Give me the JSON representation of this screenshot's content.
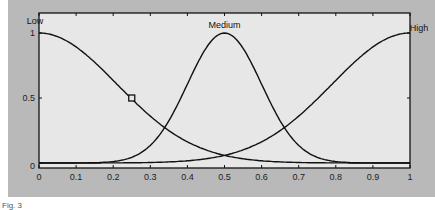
{
  "chart_data": {
    "type": "line",
    "title": "",
    "xlabel": "",
    "ylabel": "",
    "xlim": [
      0,
      1
    ],
    "ylim": [
      0,
      1
    ],
    "grid": false,
    "x_ticks": [
      "0",
      "0.1",
      "0.2",
      "0.3",
      "0.4",
      "0.5",
      "0.6",
      "0.7",
      "0.8",
      "0.9",
      "1"
    ],
    "y_ticks": [
      "0",
      "0.5",
      "1"
    ],
    "series": [
      {
        "name": "Low",
        "shape": "gaussian",
        "center": 0.0,
        "sigma": 0.21,
        "x": [
          0,
          0.1,
          0.2,
          0.25,
          0.3,
          0.4,
          0.5,
          0.6,
          0.7,
          0.8,
          0.9,
          1.0
        ],
        "values": [
          1.0,
          0.89,
          0.64,
          0.49,
          0.36,
          0.16,
          0.06,
          0.02,
          0.005,
          0.0,
          0.0,
          0.0
        ]
      },
      {
        "name": "Medium",
        "shape": "gaussian",
        "center": 0.5,
        "sigma": 0.1,
        "x": [
          0,
          0.1,
          0.2,
          0.3,
          0.35,
          0.4,
          0.5,
          0.6,
          0.65,
          0.7,
          0.8,
          0.9,
          1.0
        ],
        "values": [
          0.0,
          0.0,
          0.01,
          0.13,
          0.32,
          0.6,
          1.0,
          0.6,
          0.32,
          0.13,
          0.01,
          0.0,
          0.0
        ]
      },
      {
        "name": "High",
        "shape": "gaussian",
        "center": 1.0,
        "sigma": 0.21,
        "x": [
          0,
          0.1,
          0.2,
          0.3,
          0.4,
          0.5,
          0.6,
          0.7,
          0.75,
          0.8,
          0.9,
          1.0
        ],
        "values": [
          0.0,
          0.0,
          0.0,
          0.005,
          0.02,
          0.06,
          0.16,
          0.36,
          0.49,
          0.64,
          0.89,
          1.0
        ]
      }
    ],
    "annotations": [
      {
        "text": "Low",
        "x": 0.0,
        "y": 1.05
      },
      {
        "text": "Medium",
        "x": 0.5,
        "y": 1.1
      },
      {
        "text": "High",
        "x": 1.0,
        "y": 1.05
      }
    ],
    "markers": [
      {
        "shape": "square",
        "x": 0.25,
        "y": 0.5
      }
    ],
    "colors": {
      "frame": "#b9b9b9",
      "plot_area": "#e7e7e7",
      "line": "#111111"
    }
  },
  "caption": "Fig. 3"
}
